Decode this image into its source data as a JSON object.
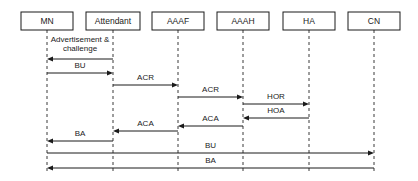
{
  "diagram": {
    "type": "sequence-diagram",
    "title": "",
    "width": 418,
    "height": 181,
    "colors": {
      "background": "#ffffff",
      "stroke": "#1a1a1a",
      "lifeline": "#3a3a3a"
    },
    "participants": [
      {
        "id": "mn",
        "label": "MN",
        "x": 47,
        "box_x": 21,
        "box_w": 52
      },
      {
        "id": "attendant",
        "label": "Attendant",
        "x": 113,
        "box_x": 86,
        "box_w": 54
      },
      {
        "id": "aaaf",
        "label": "AAAF",
        "x": 178,
        "box_x": 152,
        "box_w": 52
      },
      {
        "id": "aaah",
        "label": "AAAH",
        "x": 243,
        "box_x": 217,
        "box_w": 52
      },
      {
        "id": "ha",
        "label": "HA",
        "x": 309,
        "box_x": 283,
        "box_w": 52
      },
      {
        "id": "cn",
        "label": "CN",
        "x": 374,
        "box_x": 348,
        "box_w": 52
      }
    ],
    "box_top": 12,
    "box_height": 18,
    "lifeline_bottom": 174,
    "messages": [
      {
        "id": "m1",
        "label": "Advertisement &\nchallenge",
        "from": "attendant",
        "to": "mn",
        "y": 59,
        "direction": "left",
        "label_lines": [
          "Advertisement &",
          "challenge"
        ],
        "label_y": 40
      },
      {
        "id": "m2",
        "label": "BU",
        "from": "mn",
        "to": "attendant",
        "y": 73,
        "direction": "right",
        "label_lines": [
          "BU"
        ],
        "label_y": 66
      },
      {
        "id": "m3",
        "label": "ACR",
        "from": "attendant",
        "to": "aaaf",
        "y": 85,
        "direction": "right",
        "label_lines": [
          "ACR"
        ],
        "label_y": 78
      },
      {
        "id": "m4",
        "label": "ACR",
        "from": "aaaf",
        "to": "aaah",
        "y": 97,
        "direction": "right",
        "label_lines": [
          "ACR"
        ],
        "label_y": 90
      },
      {
        "id": "m5",
        "label": "HOR",
        "from": "aaah",
        "to": "ha",
        "y": 104,
        "direction": "right",
        "label_lines": [
          "HOR"
        ],
        "label_y": 97
      },
      {
        "id": "m6",
        "label": "HOA",
        "from": "ha",
        "to": "aaah",
        "y": 118,
        "direction": "left",
        "label_lines": [
          "HOA"
        ],
        "label_y": 111
      },
      {
        "id": "m7",
        "label": "ACA",
        "from": "aaah",
        "to": "aaaf",
        "y": 126,
        "direction": "left",
        "label_lines": [
          "ACA"
        ],
        "label_y": 119
      },
      {
        "id": "m8",
        "label": "ACA",
        "from": "aaaf",
        "to": "attendant",
        "y": 131,
        "direction": "left",
        "label_lines": [
          "ACA"
        ],
        "label_y": 124
      },
      {
        "id": "m9",
        "label": "BA",
        "from": "attendant",
        "to": "mn",
        "y": 141,
        "direction": "left",
        "label_lines": [
          "BA"
        ],
        "label_y": 134
      },
      {
        "id": "m10",
        "label": "BU",
        "from": "mn",
        "to": "cn",
        "y": 153,
        "direction": "right",
        "label_lines": [
          "BU"
        ],
        "label_y": 146
      },
      {
        "id": "m11",
        "label": "BA",
        "from": "cn",
        "to": "mn",
        "y": 168,
        "direction": "left",
        "label_lines": [
          "BA"
        ],
        "label_y": 161
      }
    ]
  }
}
